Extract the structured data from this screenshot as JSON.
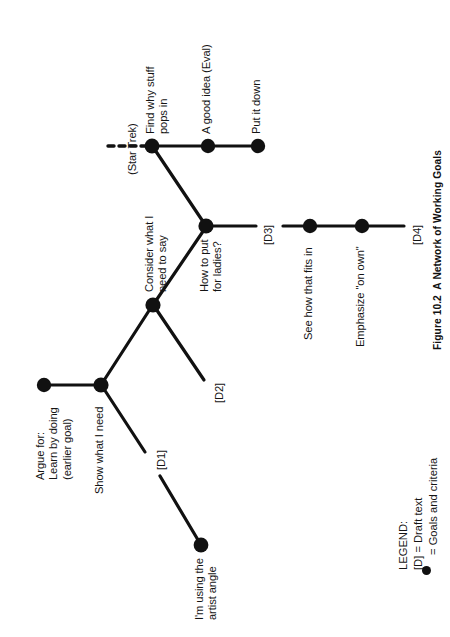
{
  "figure": {
    "number": "Figure 10.2",
    "caption": "A Network of Working Goals",
    "caption_full": "Figure 10.2  A Network of Working Goals"
  },
  "legend": {
    "title": "LEGEND:",
    "draft_line": "[D] = Draft text",
    "goal_line": "= Goals and criteria",
    "dot_icon": "filled-circle-icon"
  },
  "nodes": [
    {
      "id": "n-argue",
      "label": "Argue for:\nLearn by doing\n(earlier goal)",
      "x": 44,
      "y": 385
    },
    {
      "id": "n-show",
      "label": "Show what I need",
      "x": 101,
      "y": 385
    },
    {
      "id": "n-consider",
      "label": "Consider what I\nneed to say",
      "x": 153,
      "y": 305
    },
    {
      "id": "n-howtoput",
      "label": "How to put\nfor ladies?",
      "x": 206,
      "y": 226
    },
    {
      "id": "n-findwhy",
      "label": "Find why stuff\npops in",
      "x": 152,
      "y": 146
    },
    {
      "id": "n-goodidea",
      "label": "A good idea (Eval)",
      "x": 208,
      "y": 146
    },
    {
      "id": "n-putitdown",
      "label": "Put it down",
      "x": 258,
      "y": 146
    },
    {
      "id": "n-seehow",
      "label": "See how that fits in",
      "x": 310,
      "y": 226
    },
    {
      "id": "n-emphasize",
      "label": "Emphasize \"on own\"",
      "x": 362,
      "y": 226
    },
    {
      "id": "n-artist",
      "label": "I'm using the\nartist angle",
      "x": 201,
      "y": 545
    }
  ],
  "draft_labels": [
    {
      "id": "d1",
      "text": "[D1]"
    },
    {
      "id": "d2",
      "text": "[D2]"
    },
    {
      "id": "d3",
      "text": "[D3]"
    },
    {
      "id": "d4",
      "text": "[D4]"
    }
  ],
  "annotations": [
    {
      "id": "star-trek",
      "text": "(Star Trek)"
    }
  ],
  "style": {
    "line_color": "#111111",
    "node_color": "#111111",
    "background": "#ffffff"
  }
}
